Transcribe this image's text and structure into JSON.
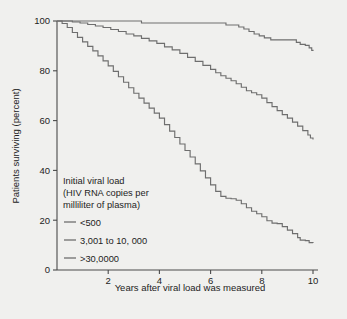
{
  "chart_data": {
    "type": "line",
    "title": "",
    "xlabel": "Years after viral load was measured",
    "ylabel": "Patients surviving (percent)",
    "xlim": [
      0,
      10
    ],
    "ylim": [
      0,
      100
    ],
    "xticks": [
      2,
      4,
      6,
      8,
      10
    ],
    "yticks": [
      0,
      20,
      40,
      60,
      80,
      100
    ],
    "xtick_labels": [
      "2",
      "4",
      "6",
      "8",
      "10"
    ],
    "ytick_labels": [
      "0",
      "20",
      "40",
      "60",
      "80",
      "100"
    ],
    "grid": false,
    "legend_position": "inside-lower-left",
    "legend_title_lines": [
      "Initial viral load",
      "(HIV RNA copies per",
      "milliliter of plasma)"
    ],
    "series": [
      {
        "name": "<500",
        "color": "#6e6e6e",
        "points": [
          [
            0.0,
            100.0
          ],
          [
            0.6,
            100.0
          ],
          [
            1.2,
            100.0
          ],
          [
            1.8,
            100.0
          ],
          [
            2.4,
            100.0
          ],
          [
            3.0,
            100.0
          ],
          [
            3.15,
            100.0
          ],
          [
            3.3,
            99.2
          ],
          [
            3.6,
            99.2
          ],
          [
            4.2,
            99.2
          ],
          [
            4.8,
            99.2
          ],
          [
            5.4,
            99.2
          ],
          [
            6.0,
            99.2
          ],
          [
            6.4,
            99.2
          ],
          [
            6.6,
            98.4
          ],
          [
            6.9,
            98.4
          ],
          [
            7.1,
            97.6
          ],
          [
            7.3,
            96.8
          ],
          [
            7.5,
            95.8
          ],
          [
            7.7,
            94.8
          ],
          [
            7.9,
            94.0
          ],
          [
            8.1,
            93.2
          ],
          [
            8.35,
            92.4
          ],
          [
            8.6,
            92.4
          ],
          [
            8.9,
            92.4
          ],
          [
            9.2,
            92.4
          ],
          [
            9.35,
            91.4
          ],
          [
            9.5,
            90.6
          ],
          [
            9.7,
            90.2
          ],
          [
            9.85,
            89.2
          ],
          [
            9.95,
            88.2
          ],
          [
            10.0,
            88.0
          ]
        ]
      },
      {
        "name": "3,001 to 10, 000",
        "color": "#6e6e6e",
        "points": [
          [
            0.0,
            100.0
          ],
          [
            0.3,
            100.0
          ],
          [
            0.6,
            99.6
          ],
          [
            0.9,
            99.2
          ],
          [
            1.2,
            98.6
          ],
          [
            1.5,
            98.0
          ],
          [
            1.8,
            97.4
          ],
          [
            2.1,
            96.6
          ],
          [
            2.4,
            95.8
          ],
          [
            2.7,
            94.8
          ],
          [
            3.0,
            94.0
          ],
          [
            3.3,
            93.0
          ],
          [
            3.6,
            92.0
          ],
          [
            3.9,
            91.0
          ],
          [
            4.2,
            89.6
          ],
          [
            4.5,
            88.4
          ],
          [
            4.8,
            87.0
          ],
          [
            5.1,
            85.4
          ],
          [
            5.4,
            83.8
          ],
          [
            5.7,
            82.2
          ],
          [
            6.0,
            80.6
          ],
          [
            6.2,
            79.2
          ],
          [
            6.4,
            78.0
          ],
          [
            6.6,
            77.0
          ],
          [
            6.8,
            76.0
          ],
          [
            7.0,
            74.8
          ],
          [
            7.2,
            73.4
          ],
          [
            7.4,
            72.0
          ],
          [
            7.6,
            71.2
          ],
          [
            7.8,
            70.4
          ],
          [
            8.0,
            69.0
          ],
          [
            8.2,
            67.2
          ],
          [
            8.4,
            65.6
          ],
          [
            8.6,
            64.0
          ],
          [
            8.8,
            62.4
          ],
          [
            9.0,
            61.0
          ],
          [
            9.2,
            59.4
          ],
          [
            9.4,
            57.8
          ],
          [
            9.6,
            56.0
          ],
          [
            9.8,
            54.2
          ],
          [
            9.9,
            53.0
          ],
          [
            10.0,
            52.4
          ]
        ]
      },
      {
        "name": ">30,0000",
        "color": "#6e6e6e",
        "points": [
          [
            0.0,
            100.0
          ],
          [
            0.2,
            99.0
          ],
          [
            0.4,
            97.4
          ],
          [
            0.6,
            95.4
          ],
          [
            0.8,
            93.4
          ],
          [
            1.0,
            91.6
          ],
          [
            1.2,
            89.8
          ],
          [
            1.4,
            88.0
          ],
          [
            1.6,
            86.0
          ],
          [
            1.8,
            84.0
          ],
          [
            2.0,
            82.0
          ],
          [
            2.2,
            79.8
          ],
          [
            2.4,
            77.6
          ],
          [
            2.6,
            75.4
          ],
          [
            2.8,
            73.2
          ],
          [
            3.0,
            71.0
          ],
          [
            3.2,
            69.0
          ],
          [
            3.4,
            67.0
          ],
          [
            3.6,
            65.0
          ],
          [
            3.8,
            63.0
          ],
          [
            4.0,
            61.0
          ],
          [
            4.2,
            58.4
          ],
          [
            4.4,
            55.8
          ],
          [
            4.6,
            53.2
          ],
          [
            4.8,
            50.6
          ],
          [
            5.0,
            48.0
          ],
          [
            5.2,
            45.4
          ],
          [
            5.4,
            42.6
          ],
          [
            5.6,
            39.8
          ],
          [
            5.8,
            37.0
          ],
          [
            6.0,
            34.2
          ],
          [
            6.2,
            31.6
          ],
          [
            6.4,
            29.6
          ],
          [
            6.6,
            28.8
          ],
          [
            6.8,
            28.6
          ],
          [
            7.0,
            28.0
          ],
          [
            7.2,
            26.6
          ],
          [
            7.4,
            25.0
          ],
          [
            7.6,
            23.6
          ],
          [
            7.8,
            22.6
          ],
          [
            8.0,
            21.4
          ],
          [
            8.2,
            19.8
          ],
          [
            8.4,
            18.8
          ],
          [
            8.6,
            18.6
          ],
          [
            8.8,
            17.4
          ],
          [
            9.0,
            16.0
          ],
          [
            9.2,
            14.6
          ],
          [
            9.4,
            13.0
          ],
          [
            9.5,
            12.0
          ],
          [
            9.7,
            11.8
          ],
          [
            9.85,
            11.0
          ],
          [
            10.0,
            10.8
          ]
        ]
      }
    ]
  },
  "legend": {
    "items": [
      {
        "label": "<500"
      },
      {
        "label": "3,001 to 10, 000"
      },
      {
        "label": ">30,0000"
      }
    ]
  },
  "colors": {
    "background": "#f0f0ee",
    "axis": "#4a4a4a",
    "curve": "#6e6e6e",
    "text": "#1d1d1d"
  }
}
